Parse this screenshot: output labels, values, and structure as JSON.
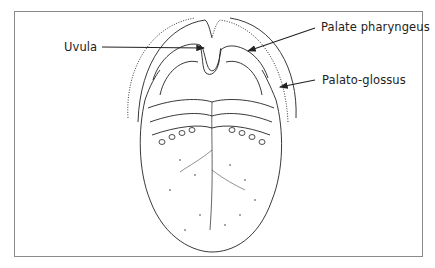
{
  "diagram": {
    "labels": [
      {
        "id": "uvula",
        "text": "Uvula"
      },
      {
        "id": "palate-pharyngeus",
        "text": "Palate pharyngeus"
      },
      {
        "id": "palato-glossus",
        "text": "Palato-glossus"
      }
    ],
    "colors": {
      "line": "#222222",
      "border": "#8a8a8a",
      "background": "#ffffff"
    }
  }
}
